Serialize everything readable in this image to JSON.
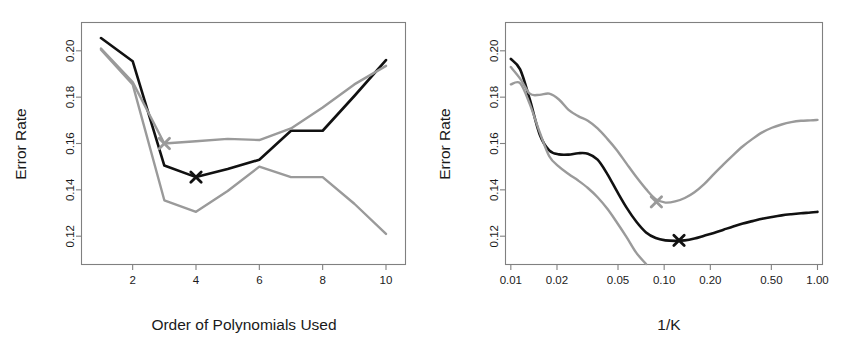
{
  "figure": {
    "background": "#ffffff",
    "black_color": "#111111",
    "gray_color": "#9a9a9a",
    "axis_color": "#808080"
  },
  "chart_data": [
    {
      "type": "line",
      "panel": "left",
      "title": "",
      "xlabel": "Order of Polynomials Used",
      "ylabel": "Error Rate",
      "xscale": "linear",
      "yscale": "linear",
      "xlim": [
        0.4,
        10.6
      ],
      "ylim": [
        0.108,
        0.212
      ],
      "xticks": [
        2,
        4,
        6,
        8,
        10
      ],
      "xticklabels": [
        "2",
        "4",
        "6",
        "8",
        "10"
      ],
      "yticks": [
        0.12,
        0.14,
        0.16,
        0.18,
        0.2
      ],
      "yticklabels": [
        "0.12",
        "0.14",
        "0.16",
        "0.18",
        "0.20"
      ],
      "grid": false,
      "legend": "none",
      "x": [
        1,
        2,
        3,
        4,
        5,
        6,
        7,
        8,
        9,
        10
      ],
      "series": [
        {
          "name": "prediction-error-black",
          "color": "#111111",
          "values": [
            0.2055,
            0.1955,
            0.1505,
            0.1455,
            0.149,
            0.153,
            0.1655,
            0.1655,
            0.1805,
            0.196
          ]
        },
        {
          "name": "cv-error-gray-upper",
          "color": "#9a9a9a",
          "values": [
            0.201,
            0.1865,
            0.16,
            0.161,
            0.162,
            0.1615,
            0.1665,
            0.1755,
            0.1855,
            0.1935
          ]
        },
        {
          "name": "error-gray-lower",
          "color": "#9a9a9a",
          "values": [
            0.2005,
            0.1855,
            0.1355,
            0.1305,
            0.1395,
            0.15,
            0.1455,
            0.1455,
            0.134,
            0.121
          ]
        }
      ],
      "markers": [
        {
          "name": "black-x-marker",
          "x": 4,
          "y": 0.1455,
          "color": "#111111",
          "symbol": "x"
        },
        {
          "name": "gray-x-marker",
          "x": 3,
          "y": 0.16,
          "color": "#9a9a9a",
          "symbol": "x"
        }
      ]
    },
    {
      "type": "line",
      "panel": "right",
      "title": "",
      "xlabel": "1/K",
      "ylabel": "Error Rate",
      "xscale": "log",
      "yscale": "linear",
      "xlim": [
        0.0093,
        1.07
      ],
      "ylim": [
        0.108,
        0.212
      ],
      "xticks": [
        0.01,
        0.02,
        0.05,
        0.1,
        0.2,
        0.5,
        1.0
      ],
      "xticklabels": [
        "0.01",
        "0.02",
        "0.05",
        "0.10",
        "0.20",
        "0.50",
        "1.00"
      ],
      "yticks": [
        0.12,
        0.14,
        0.16,
        0.18,
        0.2
      ],
      "yticklabels": [
        "0.12",
        "0.14",
        "0.16",
        "0.18",
        "0.20"
      ],
      "grid": false,
      "legend": "none",
      "x": [
        0.01,
        0.0115,
        0.0133,
        0.0154,
        0.0178,
        0.0206,
        0.0238,
        0.0275,
        0.0318,
        0.0368,
        0.0426,
        0.0493,
        0.057,
        0.0659,
        0.0762,
        0.0881,
        0.1019,
        0.1179,
        0.1363,
        0.1576,
        0.1823,
        0.2108,
        0.2438,
        0.2819,
        0.326,
        0.377,
        0.436,
        0.5043,
        0.5832,
        0.6744,
        0.7799,
        0.902,
        1.0
      ],
      "series": [
        {
          "name": "prediction-error-black",
          "color": "#111111",
          "values": [
            0.1965,
            0.192,
            0.179,
            0.164,
            0.157,
            0.1553,
            0.1552,
            0.1558,
            0.1556,
            0.153,
            0.1468,
            0.1393,
            0.1322,
            0.1262,
            0.1216,
            0.1192,
            0.1182,
            0.118,
            0.1182,
            0.119,
            0.1202,
            0.1214,
            0.1228,
            0.1242,
            0.1255,
            0.1265,
            0.1275,
            0.1283,
            0.129,
            0.1295,
            0.1299,
            0.1302,
            0.1305
          ]
        },
        {
          "name": "cv-error-gray-upper",
          "color": "#9a9a9a",
          "values": [
            0.193,
            0.188,
            0.1815,
            0.181,
            0.1815,
            0.179,
            0.1745,
            0.1718,
            0.1698,
            0.1665,
            0.162,
            0.157,
            0.1512,
            0.1455,
            0.1403,
            0.136,
            0.1345,
            0.135,
            0.1365,
            0.139,
            0.1425,
            0.1468,
            0.151,
            0.155,
            0.1588,
            0.162,
            0.1648,
            0.1668,
            0.1682,
            0.1692,
            0.1698,
            0.17,
            0.1702
          ]
        },
        {
          "name": "error-gray-lower",
          "color": "#9a9a9a",
          "values": [
            0.1855,
            0.186,
            0.177,
            0.165,
            0.1545,
            0.15,
            0.1468,
            0.144,
            0.1408,
            0.1368,
            0.1318,
            0.1258,
            0.1195,
            0.1128,
            0.108,
            null,
            null,
            null,
            null,
            null,
            null,
            null,
            null,
            null,
            null,
            null,
            null,
            null,
            null,
            null,
            null,
            null,
            null
          ]
        }
      ],
      "markers": [
        {
          "name": "black-x-marker",
          "x": 0.125,
          "y": 0.1182,
          "color": "#111111",
          "symbol": "x"
        },
        {
          "name": "gray-x-marker",
          "x": 0.089,
          "y": 0.1348,
          "color": "#9a9a9a",
          "symbol": "x"
        }
      ]
    }
  ]
}
